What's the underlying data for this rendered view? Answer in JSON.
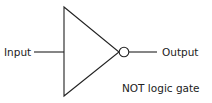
{
  "diagram": {
    "input_label": "Input",
    "output_label": "Output",
    "caption": "NOT logic gate",
    "stroke_color": "#222222"
  }
}
